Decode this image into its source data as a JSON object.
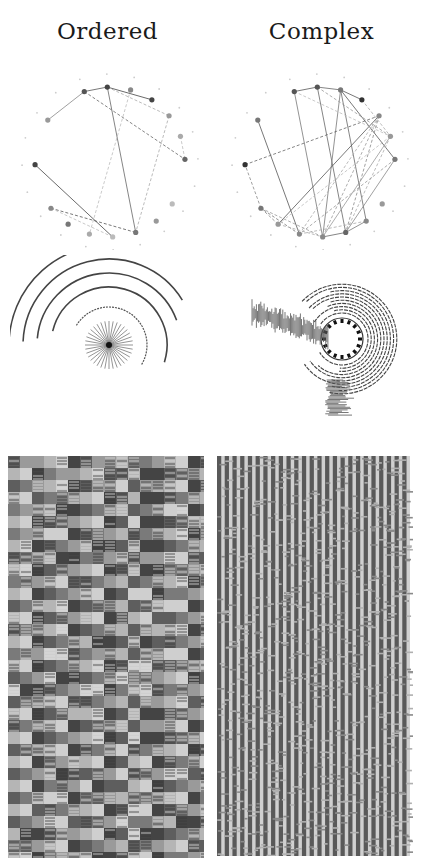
{
  "columns": [
    {
      "title": "Ordered"
    },
    {
      "title": "Complex"
    }
  ],
  "graphs": {
    "node_count": 20,
    "ordered": {
      "active_nodes": [
        {
          "i": 0,
          "shade": "#555555"
        },
        {
          "i": 1,
          "shade": "#444444"
        },
        {
          "i": 2,
          "shade": "#888888"
        },
        {
          "i": 3,
          "shade": "#444444"
        },
        {
          "i": 4,
          "shade": "#999999"
        },
        {
          "i": 5,
          "shade": "#aaaaaa"
        },
        {
          "i": 6,
          "shade": "#666666"
        },
        {
          "i": 8,
          "shade": "#bbbbbb"
        },
        {
          "i": 9,
          "shade": "#999999"
        },
        {
          "i": 10,
          "shade": "#777777"
        },
        {
          "i": 11,
          "shade": "#bbbbbb"
        },
        {
          "i": 12,
          "shade": "#aaaaaa"
        },
        {
          "i": 13,
          "shade": "#777777"
        },
        {
          "i": 14,
          "shade": "#888888"
        },
        {
          "i": 16,
          "shade": "#444444"
        },
        {
          "i": 18,
          "shade": "#999999"
        }
      ],
      "edges": [
        {
          "a": 0,
          "b": 1,
          "dash": false,
          "shade": "#555555"
        },
        {
          "a": 0,
          "b": 18,
          "dash": false,
          "shade": "#888888"
        },
        {
          "a": 1,
          "b": 3,
          "dash": false,
          "shade": "#444444"
        },
        {
          "a": 1,
          "b": 10,
          "dash": false,
          "shade": "#666666"
        },
        {
          "a": 0,
          "b": 6,
          "dash": true,
          "shade": "#666666"
        },
        {
          "a": 1,
          "b": 4,
          "dash": true,
          "shade": "#aaaaaa"
        },
        {
          "a": 2,
          "b": 12,
          "dash": true,
          "shade": "#bbbbbb"
        },
        {
          "a": 4,
          "b": 10,
          "dash": true,
          "shade": "#aaaaaa"
        },
        {
          "a": 5,
          "b": 6,
          "dash": true,
          "shade": "#bbbbbb"
        },
        {
          "a": 14,
          "b": 10,
          "dash": true,
          "shade": "#555555"
        },
        {
          "a": 14,
          "b": 11,
          "dash": true,
          "shade": "#bbbbbb"
        },
        {
          "a": 16,
          "b": 11,
          "dash": false,
          "shade": "#444444"
        }
      ]
    },
    "complex": {
      "active_nodes": [
        {
          "i": 0,
          "shade": "#555555"
        },
        {
          "i": 1,
          "shade": "#555555"
        },
        {
          "i": 2,
          "shade": "#777777"
        },
        {
          "i": 3,
          "shade": "#333333"
        },
        {
          "i": 4,
          "shade": "#888888"
        },
        {
          "i": 5,
          "shade": "#999999"
        },
        {
          "i": 6,
          "shade": "#777777"
        },
        {
          "i": 8,
          "shade": "#999999"
        },
        {
          "i": 9,
          "shade": "#888888"
        },
        {
          "i": 10,
          "shade": "#666666"
        },
        {
          "i": 11,
          "shade": "#888888"
        },
        {
          "i": 12,
          "shade": "#888888"
        },
        {
          "i": 13,
          "shade": "#999999"
        },
        {
          "i": 14,
          "shade": "#777777"
        },
        {
          "i": 16,
          "shade": "#333333"
        },
        {
          "i": 18,
          "shade": "#777777"
        }
      ],
      "edges": [
        {
          "a": 0,
          "b": 1,
          "dash": false,
          "shade": "#555555"
        },
        {
          "a": 1,
          "b": 2,
          "dash": false,
          "shade": "#666666"
        },
        {
          "a": 0,
          "b": 11,
          "dash": false,
          "shade": "#777777"
        },
        {
          "a": 18,
          "b": 12,
          "dash": false,
          "shade": "#555555"
        },
        {
          "a": 1,
          "b": 10,
          "dash": false,
          "shade": "#666666"
        },
        {
          "a": 2,
          "b": 6,
          "dash": false,
          "shade": "#555555"
        },
        {
          "a": 2,
          "b": 11,
          "dash": false,
          "shade": "#777777"
        },
        {
          "a": 2,
          "b": 9,
          "dash": false,
          "shade": "#666666"
        },
        {
          "a": 16,
          "b": 4,
          "dash": true,
          "shade": "#666666"
        },
        {
          "a": 4,
          "b": 13,
          "dash": false,
          "shade": "#555555"
        },
        {
          "a": 4,
          "b": 10,
          "dash": true,
          "shade": "#888888"
        },
        {
          "a": 4,
          "b": 11,
          "dash": true,
          "shade": "#999999"
        },
        {
          "a": 4,
          "b": 12,
          "dash": true,
          "shade": "#aaaaaa"
        },
        {
          "a": 5,
          "b": 10,
          "dash": true,
          "shade": "#aaaaaa"
        },
        {
          "a": 5,
          "b": 13,
          "dash": true,
          "shade": "#bbbbbb"
        },
        {
          "a": 6,
          "b": 10,
          "dash": false,
          "shade": "#888888"
        },
        {
          "a": 6,
          "b": 12,
          "dash": true,
          "shade": "#999999"
        },
        {
          "a": 9,
          "b": 10,
          "dash": false,
          "shade": "#777777"
        },
        {
          "a": 10,
          "b": 11,
          "dash": false,
          "shade": "#666666"
        },
        {
          "a": 12,
          "b": 14,
          "dash": true,
          "shade": "#777777"
        },
        {
          "a": 13,
          "b": 14,
          "dash": true,
          "shade": "#888888"
        },
        {
          "a": 14,
          "b": 11,
          "dash": true,
          "shade": "#999999"
        },
        {
          "a": 3,
          "b": 5,
          "dash": true,
          "shade": "#aaaaaa"
        },
        {
          "a": 0,
          "b": 5,
          "dash": true,
          "shade": "#bbbbbb"
        },
        {
          "a": 1,
          "b": 5,
          "dash": true,
          "shade": "#999999"
        },
        {
          "a": 14,
          "b": 16,
          "dash": true,
          "shade": "#888888"
        },
        {
          "a": 13,
          "b": 11,
          "dash": true,
          "shade": "#aaaaaa"
        },
        {
          "a": 12,
          "b": 9,
          "dash": true,
          "shade": "#aaaaaa"
        },
        {
          "a": 5,
          "b": 11,
          "dash": false,
          "shade": "#999999"
        },
        {
          "a": 3,
          "b": 2,
          "dash": false,
          "shade": "#555555"
        }
      ]
    }
  },
  "spirals": {
    "ordered": {
      "arc_count": 5,
      "spoke_count": 36
    },
    "complex": {
      "ring_count": 10,
      "marker_count": 16
    }
  },
  "rasters": {
    "ordered": {
      "columns": 80,
      "rows": 200,
      "palette": [
        "#5e5e5e",
        "#7a7a7a",
        "#9a9a9a",
        "#b5b5b5",
        "#cfcfcf",
        "#444444"
      ]
    },
    "complex": {
      "stripe_count": 25,
      "palette": [
        "#595959",
        "#d0d0d0",
        "#8a8a8a",
        "#b0b0b0"
      ]
    }
  }
}
